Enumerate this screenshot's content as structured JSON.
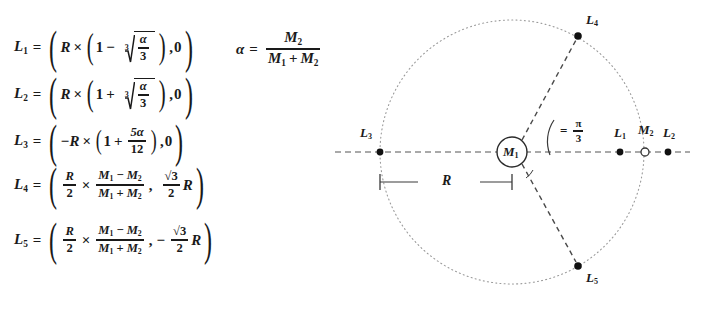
{
  "figure": {
    "background_color": "#ffffff",
    "ink_color": "#1a1a1a"
  },
  "equations": {
    "alpha_definition": {
      "lhs": "α",
      "equals": "=",
      "numerator": "M",
      "numerator_sub": "2",
      "denominator_left": "M",
      "denominator_left_sub": "1",
      "denominator_op": "+",
      "denominator_right": "M",
      "denominator_right_sub": "2",
      "plain": "α = M₂ / (M₁ + M₂)"
    },
    "items": [
      {
        "id": "L1",
        "label": "L",
        "label_sub": "1",
        "equals": "=",
        "plain": "L₁ = ( R × ( 1 − ∛(α/3) ), 0 )",
        "factor": "R",
        "times": "×",
        "one": "1",
        "sign": "−",
        "radical_index": "3",
        "radicand_num": "α",
        "radicand_den": "3",
        "second_coord": "0"
      },
      {
        "id": "L2",
        "label": "L",
        "label_sub": "2",
        "equals": "=",
        "plain": "L₂ = ( R × ( 1 + ∛(α/3) ), 0 )",
        "factor": "R",
        "times": "×",
        "one": "1",
        "sign": "+",
        "radical_index": "3",
        "radicand_num": "α",
        "radicand_den": "3",
        "second_coord": "0"
      },
      {
        "id": "L3",
        "label": "L",
        "label_sub": "3",
        "equals": "=",
        "plain": "L₃ = ( −R × ( 1 + 5α/12 ), 0 )",
        "factor": "−R",
        "times": "×",
        "one": "1",
        "sign": "+",
        "frac_num": "5α",
        "frac_den": "12",
        "second_coord": "0"
      },
      {
        "id": "L4",
        "label": "L",
        "label_sub": "4",
        "equals": "=",
        "plain": "L₄ = ( R/2 × (M₁−M₂)/(M₁+M₂), (√3/2)R )",
        "first_num": "R",
        "first_den": "2",
        "times": "×",
        "mass_num_left": "M",
        "mass_num_left_sub": "1",
        "mass_num_op": "−",
        "mass_num_right": "M",
        "mass_num_right_sub": "2",
        "mass_den_left": "M",
        "mass_den_left_sub": "1",
        "mass_den_op": "+",
        "mass_den_right": "M",
        "mass_den_right_sub": "2",
        "y_sign": "",
        "y_num": "√3",
        "y_den": "2",
        "y_factor": "R"
      },
      {
        "id": "L5",
        "label": "L",
        "label_sub": "5",
        "equals": "=",
        "plain": "L₅ = ( R/2 × (M₁−M₂)/(M₁+M₂), −(√3/2)R )",
        "first_num": "R",
        "first_den": "2",
        "times": "×",
        "mass_num_left": "M",
        "mass_num_left_sub": "1",
        "mass_num_op": "−",
        "mass_num_right": "M",
        "mass_num_right_sub": "2",
        "mass_den_left": "M",
        "mass_den_left_sub": "1",
        "mass_den_op": "+",
        "mass_den_right": "M",
        "mass_den_right_sub": "2",
        "y_sign": "−",
        "y_num": "√3",
        "y_den": "2",
        "y_factor": "R"
      }
    ]
  },
  "diagram": {
    "center_body": {
      "label": "M",
      "label_sub": "1"
    },
    "orbit_circle": {
      "cx": 182,
      "cy": 152,
      "r": 132,
      "style": "dotted"
    },
    "axis": {
      "style": "dashed",
      "y": 152,
      "x_start": 5,
      "x_end": 360
    },
    "angle": {
      "equals": "=",
      "numerator": "π",
      "denominator": "3",
      "plain": "= π/3"
    },
    "radius_dimension": {
      "label": "R",
      "x_start": 50,
      "x_end": 182,
      "y": 182
    },
    "points": [
      {
        "id": "L3",
        "label": "L",
        "sub": "3",
        "x": 50,
        "y": 152,
        "marker": "filled",
        "label_dx": -20,
        "label_dy": -24
      },
      {
        "id": "M1",
        "label": "M",
        "sub": "1",
        "x": 182,
        "y": 152,
        "marker": "circled",
        "label_dx": 0,
        "label_dy": 0
      },
      {
        "id": "L1",
        "label": "L",
        "sub": "1",
        "x": 290,
        "y": 152,
        "marker": "filled",
        "label_dx": -5,
        "label_dy": -24
      },
      {
        "id": "M2",
        "label": "M",
        "sub": "2",
        "x": 315,
        "y": 152,
        "marker": "open",
        "label_dx": -4,
        "label_dy": -26
      },
      {
        "id": "L2",
        "label": "L",
        "sub": "2",
        "x": 338,
        "y": 152,
        "marker": "filled",
        "label_dx": -5,
        "label_dy": -24
      },
      {
        "id": "L4",
        "label": "L",
        "sub": "4",
        "x": 248,
        "y": 36,
        "marker": "filled",
        "label_dx": 7,
        "label_dy": -22
      },
      {
        "id": "L5",
        "label": "L",
        "sub": "5",
        "x": 248,
        "y": 266,
        "marker": "filled",
        "label_dx": 7,
        "label_dy": 4
      }
    ]
  }
}
